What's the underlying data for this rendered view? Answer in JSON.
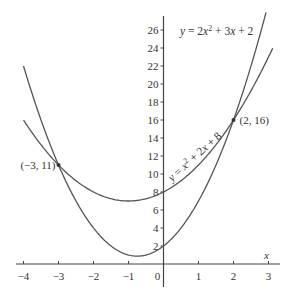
{
  "chart_data": {
    "type": "line",
    "title": "",
    "xlabel": "x",
    "ylabel": "",
    "xlim": [
      -4.2,
      3.2
    ],
    "ylim": [
      0,
      27
    ],
    "grid": false,
    "x_ticks": [
      -4,
      -3,
      -2,
      -1,
      0,
      1,
      2,
      3
    ],
    "y_ticks": [
      2,
      4,
      6,
      8,
      10,
      12,
      14,
      16,
      18,
      20,
      22,
      24,
      26
    ],
    "series": [
      {
        "name": "y = 2x² + 3x + 2",
        "formula": {
          "a": 2,
          "b": 3,
          "c": 2
        },
        "x_range": [
          -4,
          2.93
        ]
      },
      {
        "name": "y = x² + 2x + 8",
        "formula": {
          "a": 1,
          "b": 2,
          "c": 8
        },
        "x_range": [
          -4,
          3.12
        ]
      }
    ],
    "annotations": [
      {
        "text": "(−3, 11)",
        "x": -3,
        "y": 11
      },
      {
        "text": "(2, 16)",
        "x": 2,
        "y": 16
      }
    ],
    "labels": {
      "curve1": {
        "prefix": "y = 2x",
        "sup": "2",
        "suffix": " + 3x + 2"
      },
      "curve2": {
        "prefix": "y = x",
        "sup": "2",
        "suffix": " + 2x + 8"
      }
    },
    "axis_color": "#444444",
    "curve_color": "#555555"
  }
}
